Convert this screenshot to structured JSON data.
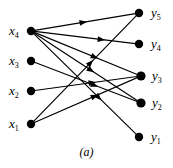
{
  "figure": {
    "caption": "(a)",
    "type": "bipartite-directed-graph",
    "width": 173,
    "height": 168,
    "background_color": "#ffffff",
    "ink_color": "#000000"
  },
  "left_nodes": [
    {
      "id": "x4",
      "base": "x",
      "sub": "4",
      "label": "x4",
      "cx": 31,
      "cy": 31,
      "r": 4.2,
      "label_x": 9,
      "label_y": 24
    },
    {
      "id": "x3",
      "base": "x",
      "sub": "3",
      "label": "x3",
      "cx": 31,
      "cy": 61,
      "r": 4.2,
      "label_x": 9,
      "label_y": 54
    },
    {
      "id": "x2",
      "base": "x",
      "sub": "2",
      "label": "x2",
      "cx": 31,
      "cy": 91,
      "r": 4.2,
      "label_x": 9,
      "label_y": 84
    },
    {
      "id": "x1",
      "base": "x",
      "sub": "1",
      "label": "x1",
      "cx": 31,
      "cy": 124,
      "r": 4.2,
      "label_x": 9,
      "label_y": 117
    }
  ],
  "right_nodes": [
    {
      "id": "y5",
      "base": "y",
      "sub": "5",
      "label": "y5",
      "cx": 139,
      "cy": 13,
      "r": 4.2,
      "label_x": 151,
      "label_y": 6
    },
    {
      "id": "y4",
      "base": "y",
      "sub": "4",
      "label": "y4",
      "cx": 139,
      "cy": 44,
      "r": 4.2,
      "label_x": 151,
      "label_y": 37
    },
    {
      "id": "y3",
      "base": "y",
      "sub": "3",
      "label": "y3",
      "cx": 141,
      "cy": 76,
      "r": 4.6,
      "label_x": 152,
      "label_y": 69
    },
    {
      "id": "y2",
      "base": "y",
      "sub": "2",
      "label": "y2",
      "cx": 141,
      "cy": 103,
      "r": 4.6,
      "label_x": 152,
      "label_y": 96
    },
    {
      "id": "y1",
      "base": "y",
      "sub": "1",
      "label": "y1",
      "cx": 139,
      "cy": 137,
      "r": 4.2,
      "label_x": 151,
      "label_y": 130
    }
  ],
  "edges": [
    {
      "id": "e1",
      "from": "x4",
      "to": "y5",
      "arrow_t": 0.52
    },
    {
      "id": "e2",
      "from": "x4",
      "to": "y4",
      "arrow_t": 0.7
    },
    {
      "id": "e3",
      "from": "x4",
      "to": "y3",
      "arrow_t": 0.62
    },
    {
      "id": "e4",
      "from": "x4",
      "to": "y2",
      "arrow_t": 0.58
    },
    {
      "id": "e5",
      "from": "x4",
      "to": "y1",
      "arrow_t": 0.66
    },
    {
      "id": "e6",
      "from": "x3",
      "to": "y2",
      "arrow_t": 0.62
    },
    {
      "id": "e7",
      "from": "x2",
      "to": "y3",
      "arrow_t": 0.6
    },
    {
      "id": "e8",
      "from": "x1",
      "to": "y5",
      "arrow_t": 0.58
    },
    {
      "id": "e9",
      "from": "x1",
      "to": "y3",
      "arrow_t": 0.62
    }
  ],
  "caption_pos": {
    "y": 145
  }
}
